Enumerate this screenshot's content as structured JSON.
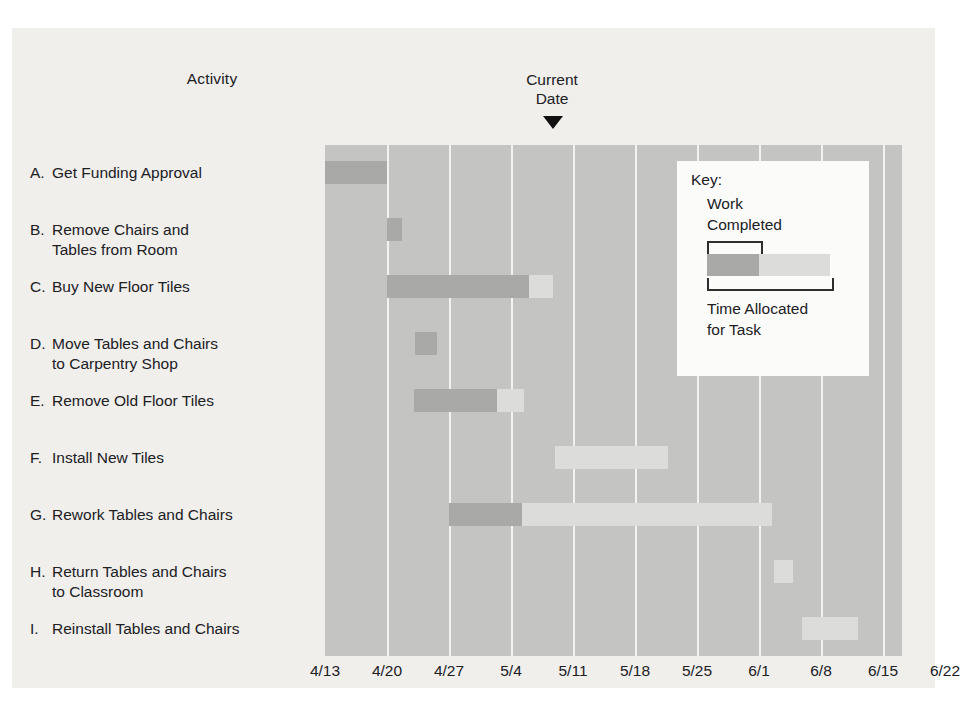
{
  "headers": {
    "activity_title": "Activity",
    "current_date_line1": "Current",
    "current_date_line2": "Date",
    "current_date_marker": "triangle-down-marker"
  },
  "key": {
    "title": "Key:",
    "work_completed_line1": "Work",
    "work_completed_line2": "Completed",
    "time_allocated_line1": "Time Allocated",
    "time_allocated_line2": "for Task"
  },
  "colors": {
    "figure_background": "#f0efec",
    "plot_background": "#c4c4c3",
    "gridline": "#f2f2f0",
    "work_completed": "#a9a9a8",
    "time_allocated": "#dcdcda",
    "key_background": "#fbfbfa",
    "text": "#20201f",
    "marker": "#111111"
  },
  "activities": [
    {
      "key": "A.",
      "label": "Get Funding Approval",
      "line2": ""
    },
    {
      "key": "B.",
      "label": "Remove Chairs and",
      "line2": "Tables from Room"
    },
    {
      "key": "C.",
      "label": "Buy New Floor Tiles",
      "line2": ""
    },
    {
      "key": "D.",
      "label": "Move Tables and Chairs",
      "line2": "to Carpentry Shop"
    },
    {
      "key": "E.",
      "label": "Remove Old Floor Tiles",
      "line2": ""
    },
    {
      "key": "F.",
      "label": "Install New Tiles",
      "line2": ""
    },
    {
      "key": "G.",
      "label": "Rework Tables and Chairs",
      "line2": ""
    },
    {
      "key": "H.",
      "label": "Return Tables and Chairs",
      "line2": "to Classroom"
    },
    {
      "key": "I.",
      "label": "Reinstall Tables and Chairs",
      "line2": ""
    }
  ],
  "xaxis": {
    "labels": [
      "4/13",
      "4/20",
      "4/27",
      "5/4",
      "5/11",
      "5/18",
      "5/25",
      "6/1",
      "6/8",
      "6/15",
      "6/22"
    ]
  },
  "chart_data": {
    "type": "bar",
    "chart_kind": "gantt",
    "title": "",
    "xlabel": "",
    "ylabel": "Activity",
    "x_tick_labels": [
      "4/13",
      "4/20",
      "4/27",
      "5/4",
      "5/11",
      "5/18",
      "5/25",
      "6/1",
      "6/8",
      "6/15",
      "6/22"
    ],
    "x_tick_units_days": 7,
    "current_date": "5/11",
    "legend": [
      "Work Completed",
      "Time Allocated for Task"
    ],
    "legend_position": "inside-top-right",
    "grid": true,
    "categories": [
      "A. Get Funding Approval",
      "B. Remove Chairs and Tables from Room",
      "C. Buy New Floor Tiles",
      "D. Move Tables and Chairs to Carpentry Shop",
      "E. Remove Old Floor Tiles",
      "F. Install New Tiles",
      "G. Rework Tables and Chairs",
      "H. Return Tables and Chairs to Classroom",
      "I. Reinstall Tables and Chairs"
    ],
    "bars": [
      {
        "activity": "A",
        "start": "4/13",
        "end": "4/20",
        "completed_end": "4/20",
        "completed_days": 7,
        "allocated_days": 7,
        "pct_complete": 100
      },
      {
        "activity": "B",
        "start": "4/20",
        "end": "4/22",
        "completed_end": "4/22",
        "completed_days": 2,
        "allocated_days": 2,
        "pct_complete": 100
      },
      {
        "activity": "C",
        "start": "4/20",
        "end": "5/11",
        "completed_end": "5/08",
        "completed_days": 18,
        "allocated_days": 21,
        "pct_complete": 86
      },
      {
        "activity": "D",
        "start": "4/23",
        "end": "4/26",
        "completed_end": "4/26",
        "completed_days": 3,
        "allocated_days": 3,
        "pct_complete": 100
      },
      {
        "activity": "E",
        "start": "4/23",
        "end": "5/06",
        "completed_end": "5/03",
        "completed_days": 10,
        "allocated_days": 13,
        "pct_complete": 77
      },
      {
        "activity": "F",
        "start": "5/11",
        "end": "5/25",
        "completed_end": "5/11",
        "completed_days": 0,
        "allocated_days": 14,
        "pct_complete": 0
      },
      {
        "activity": "G",
        "start": "4/27",
        "end": "6/01",
        "completed_end": "5/07",
        "completed_days": 10,
        "allocated_days": 35,
        "pct_complete": 29
      },
      {
        "activity": "H",
        "start": "6/02",
        "end": "6/04",
        "completed_end": "6/02",
        "completed_days": 0,
        "allocated_days": 2,
        "pct_complete": 0
      },
      {
        "activity": "I",
        "start": "6/06",
        "end": "6/12",
        "completed_end": "6/06",
        "completed_days": 0,
        "allocated_days": 6,
        "pct_complete": 0
      }
    ]
  },
  "geometry": {
    "plot_left_px": 313,
    "plot_top_px": 117,
    "plot_width_px": 577,
    "plot_height_px": 511,
    "tick_spacing_px": 62,
    "row_tops_px": [
      16,
      73,
      130,
      187,
      244,
      301,
      358,
      415,
      472
    ],
    "bars_px": [
      {
        "left": 0,
        "done": 62,
        "todo": 0
      },
      {
        "left": 62,
        "done": 15,
        "todo": 0
      },
      {
        "left": 62,
        "done": 142,
        "todo": 24
      },
      {
        "left": 90,
        "done": 22,
        "todo": 0
      },
      {
        "left": 89,
        "done": 83,
        "todo": 27
      },
      {
        "left": 230,
        "done": 0,
        "todo": 113
      },
      {
        "left": 124,
        "done": 73,
        "todo": 250
      },
      {
        "left": 449,
        "done": 0,
        "todo": 19
      },
      {
        "left": 477,
        "done": 0,
        "todo": 56
      }
    ]
  }
}
